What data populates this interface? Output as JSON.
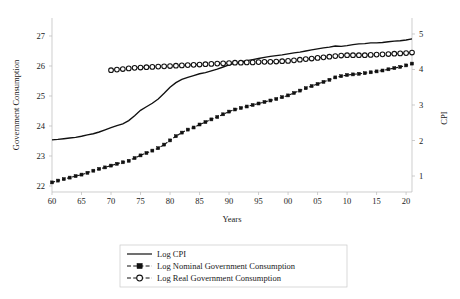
{
  "chart_data": {
    "type": "line",
    "title": "",
    "xlabel": "Years",
    "ylabel": "Government Consumption",
    "y2label": "CPI",
    "grid": false,
    "legend_position": "bottom-center",
    "xlim": [
      1960,
      2021
    ],
    "ylim": [
      21.8,
      27.6
    ],
    "y2lim": [
      0.55,
      5.45
    ],
    "xticks": [
      "60",
      "65",
      "70",
      "75",
      "80",
      "85",
      "90",
      "95",
      "00",
      "05",
      "10",
      "15",
      "20"
    ],
    "xtick_values": [
      1960,
      1965,
      1970,
      1975,
      1980,
      1985,
      1990,
      1995,
      2000,
      2005,
      2010,
      2015,
      2020
    ],
    "yticks": [
      "22",
      "23",
      "24",
      "25",
      "26",
      "27"
    ],
    "ytick_values": [
      22,
      23,
      24,
      25,
      26,
      27
    ],
    "y2ticks": [
      "1",
      "2",
      "3",
      "4",
      "5"
    ],
    "y2tick_values": [
      1,
      2,
      3,
      4,
      5
    ],
    "series": [
      {
        "name": "Log CPI",
        "axis": "right",
        "style": "solid",
        "marker": "none",
        "color": "#111111",
        "x": [
          1960,
          1961,
          1962,
          1963,
          1964,
          1965,
          1966,
          1967,
          1968,
          1969,
          1970,
          1971,
          1972,
          1973,
          1974,
          1975,
          1976,
          1977,
          1978,
          1979,
          1980,
          1981,
          1982,
          1983,
          1984,
          1985,
          1986,
          1987,
          1988,
          1989,
          1990,
          1991,
          1992,
          1993,
          1994,
          1995,
          1996,
          1997,
          1998,
          1999,
          2000,
          2001,
          2002,
          2003,
          2004,
          2005,
          2006,
          2007,
          2008,
          2009,
          2010,
          2011,
          2012,
          2013,
          2014,
          2015,
          2016,
          2017,
          2018,
          2019,
          2020,
          2021
        ],
        "y": [
          2.02,
          2.03,
          2.05,
          2.07,
          2.09,
          2.12,
          2.16,
          2.19,
          2.24,
          2.3,
          2.36,
          2.42,
          2.47,
          2.56,
          2.7,
          2.85,
          2.95,
          3.05,
          3.17,
          3.33,
          3.5,
          3.63,
          3.72,
          3.78,
          3.83,
          3.88,
          3.91,
          3.96,
          4.01,
          4.07,
          4.13,
          4.18,
          4.21,
          4.25,
          4.28,
          4.31,
          4.34,
          4.37,
          4.39,
          4.41,
          4.44,
          4.47,
          4.49,
          4.52,
          4.55,
          4.58,
          4.61,
          4.63,
          4.66,
          4.65,
          4.67,
          4.7,
          4.72,
          4.73,
          4.75,
          4.75,
          4.76,
          4.78,
          4.8,
          4.81,
          4.83,
          4.86
        ]
      },
      {
        "name": "Log Nominal Government Consumption",
        "axis": "left",
        "style": "dashed",
        "marker": "square",
        "color": "#111111",
        "x": [
          1960,
          1961,
          1962,
          1963,
          1964,
          1965,
          1966,
          1967,
          1968,
          1969,
          1970,
          1971,
          1972,
          1973,
          1974,
          1975,
          1976,
          1977,
          1978,
          1979,
          1980,
          1981,
          1982,
          1983,
          1984,
          1985,
          1986,
          1987,
          1988,
          1989,
          1990,
          1991,
          1992,
          1993,
          1994,
          1995,
          1996,
          1997,
          1998,
          1999,
          2000,
          2001,
          2002,
          2003,
          2004,
          2005,
          2006,
          2007,
          2008,
          2009,
          2010,
          2011,
          2012,
          2013,
          2014,
          2015,
          2016,
          2017,
          2018,
          2019,
          2020,
          2021
        ],
        "y": [
          22.12,
          22.18,
          22.23,
          22.28,
          22.33,
          22.38,
          22.44,
          22.51,
          22.57,
          22.62,
          22.68,
          22.74,
          22.79,
          22.84,
          22.93,
          23.02,
          23.1,
          23.18,
          23.26,
          23.38,
          23.52,
          23.66,
          23.78,
          23.88,
          23.95,
          24.05,
          24.13,
          24.22,
          24.3,
          24.39,
          24.48,
          24.55,
          24.6,
          24.65,
          24.7,
          24.75,
          24.8,
          24.85,
          24.9,
          24.96,
          25.02,
          25.1,
          25.18,
          25.26,
          25.33,
          25.4,
          25.47,
          25.54,
          25.62,
          25.66,
          25.7,
          25.72,
          25.74,
          25.76,
          25.79,
          25.82,
          25.85,
          25.89,
          25.93,
          25.97,
          26.02,
          26.08
        ]
      },
      {
        "name": "Log Real Government Consumption",
        "axis": "left",
        "style": "dashed",
        "marker": "circle",
        "color": "#111111",
        "x": [
          1970,
          1971,
          1972,
          1973,
          1974,
          1975,
          1976,
          1977,
          1978,
          1979,
          1980,
          1981,
          1982,
          1983,
          1984,
          1985,
          1986,
          1987,
          1988,
          1989,
          1990,
          1991,
          1992,
          1993,
          1994,
          1995,
          1996,
          1997,
          1998,
          1999,
          2000,
          2001,
          2002,
          2003,
          2004,
          2005,
          2006,
          2007,
          2008,
          2009,
          2010,
          2011,
          2012,
          2013,
          2014,
          2015,
          2016,
          2017,
          2018,
          2019,
          2020,
          2021
        ],
        "y": [
          25.86,
          25.88,
          25.9,
          25.92,
          25.94,
          25.95,
          25.96,
          25.97,
          25.98,
          25.99,
          26.0,
          26.01,
          26.02,
          26.03,
          26.04,
          26.05,
          26.06,
          26.07,
          26.08,
          26.09,
          26.1,
          26.11,
          26.11,
          26.12,
          26.12,
          26.13,
          26.14,
          26.14,
          26.15,
          26.16,
          26.17,
          26.19,
          26.21,
          26.23,
          26.25,
          26.27,
          26.29,
          26.31,
          26.33,
          26.35,
          26.36,
          26.36,
          26.36,
          26.36,
          26.37,
          26.38,
          26.39,
          26.4,
          26.41,
          26.42,
          26.43,
          26.45
        ]
      }
    ]
  },
  "legend": {
    "entries": [
      {
        "label": "Log CPI"
      },
      {
        "label": "Log Nominal Government Consumption"
      },
      {
        "label": "Log Real Government Consumption"
      }
    ]
  }
}
